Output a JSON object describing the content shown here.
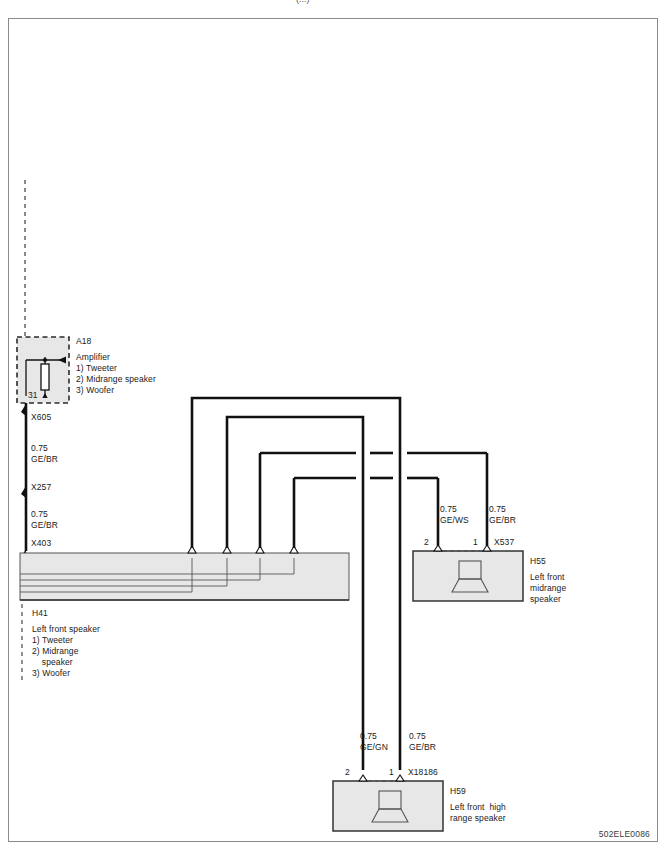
{
  "document": {
    "id_code": "502ELE0086",
    "top_cut_label": "(...)"
  },
  "components": {
    "amplifier": {
      "ref": "A18",
      "name": "Amplifier",
      "legend": [
        "1) Tweeter",
        "2) Midrange speaker",
        "3) Woofer"
      ],
      "ground_pin": "31"
    },
    "left_front_speaker": {
      "ref": "H41",
      "name": "Left front speaker",
      "legend": [
        "1) Tweeter",
        "2) Midrange",
        "    speaker",
        "3) Woofer"
      ]
    },
    "midrange_speaker": {
      "ref": "H55",
      "name_lines": [
        "Left front",
        "midrange",
        "speaker"
      ],
      "connector": "X537",
      "pins": [
        "2",
        "1"
      ]
    },
    "high_range_speaker": {
      "ref": "H59",
      "name_lines": [
        "Left front  high",
        "range speaker"
      ],
      "connector": "X18186",
      "pins": [
        "2",
        "1"
      ]
    }
  },
  "connectors": [
    {
      "id": "X605",
      "x": 30,
      "y": 424
    },
    {
      "id": "X257",
      "x": 30,
      "y": 494
    },
    {
      "id": "X403",
      "x": 30,
      "y": 549
    }
  ],
  "wires": [
    {
      "id": "w-amp-x605",
      "size": "0.75",
      "color_code": "GE/BR",
      "label_x": 30,
      "label_y": 447
    },
    {
      "id": "w-x257-x403",
      "size": "0.75",
      "color_code": "GE/BR",
      "label_x": 30,
      "label_y": 513
    },
    {
      "id": "w-h55-pin2",
      "size": "0.75",
      "color_code": "GE/WS",
      "label_x": 440,
      "label_y": 508
    },
    {
      "id": "w-h55-pin1",
      "size": "0.75",
      "color_code": "GE/BR",
      "label_x": 489,
      "label_y": 508
    },
    {
      "id": "w-h59-pin2",
      "size": "0.75",
      "color_code": "GE/GN",
      "label_x": 360,
      "label_y": 735
    },
    {
      "id": "w-h59-pin1",
      "size": "0.75",
      "color_code": "GE/BR",
      "label_x": 409,
      "label_y": 735
    }
  ],
  "colors": {
    "wire_black": "#111111",
    "box_fill": "#e7e7e7",
    "box_stroke": "#444444",
    "border": "#8a8a8a",
    "dashed": "#4a4a4a"
  }
}
